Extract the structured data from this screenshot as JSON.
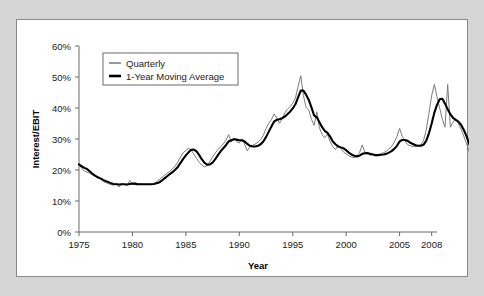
{
  "figure": {
    "background_color": "#d5d5d5",
    "panel_color": "#ffffff",
    "border_color": "#8a8a8a"
  },
  "chart_data": {
    "type": "line",
    "title": "",
    "xlabel": "Year",
    "ylabel": "Interest/EBIT",
    "xlim": [
      1975,
      2008.5
    ],
    "ylim": [
      0,
      60
    ],
    "grid": false,
    "legend_position": "top-left",
    "x_tick_labels": [
      "1975",
      "1980",
      "1985",
      "1990",
      "1995",
      "2000",
      "2005",
      "2008"
    ],
    "x_ticks": [
      1975,
      1980,
      1985,
      1990,
      1995,
      2000,
      2005,
      2008
    ],
    "y_tick_labels": [
      "0%",
      "10%",
      "20%",
      "30%",
      "40%",
      "50%",
      "60%"
    ],
    "y_ticks": [
      0,
      10,
      20,
      30,
      40,
      50,
      60
    ],
    "series": [
      {
        "name": "Quarterly",
        "color": "#6e6e6e",
        "width": 0.9,
        "x_start": 1975.0,
        "x_step": 0.25,
        "values": [
          21.8,
          20.6,
          19.6,
          19.3,
          19.0,
          18.4,
          18.0,
          17.3,
          17.4,
          16.3,
          16.0,
          15.6,
          15.3,
          15.1,
          15.8,
          14.5,
          15.6,
          15.3,
          15.1,
          16.6,
          15.4,
          15.3,
          15.2,
          15.6,
          15.4,
          15.4,
          15.4,
          15.4,
          15.6,
          16.2,
          16.9,
          17.6,
          18.3,
          19.0,
          19.6,
          20.4,
          21.2,
          22.6,
          24.2,
          25.6,
          26.3,
          27.0,
          26.4,
          25.1,
          23.7,
          22.5,
          21.5,
          21.0,
          21.4,
          22.8,
          24.2,
          25.5,
          26.6,
          27.5,
          28.4,
          29.6,
          31.4,
          29.0,
          30.3,
          29.2,
          28.7,
          30.0,
          28.3,
          26.2,
          27.6,
          28.0,
          28.4,
          29.0,
          29.8,
          31.2,
          33.4,
          35.0,
          36.2,
          38.1,
          36.8,
          35.1,
          36.4,
          38.4,
          39.6,
          40.4,
          41.6,
          43.2,
          46.9,
          50.4,
          44.0,
          40.2,
          39.4,
          36.4,
          34.4,
          38.8,
          33.6,
          31.4,
          30.4,
          31.6,
          29.2,
          27.5,
          26.6,
          28.1,
          26.8,
          25.8,
          25.2,
          24.6,
          24.2,
          24.0,
          24.4,
          25.6,
          28.1,
          25.8,
          25.2,
          24.8,
          25.0,
          24.6,
          24.8,
          25.2,
          25.6,
          26.0,
          26.8,
          27.6,
          29.0,
          30.8,
          33.4,
          30.8,
          29.4,
          28.2,
          27.8,
          27.6,
          27.6,
          27.8,
          28.2,
          29.6,
          33.0,
          38.4,
          44.0,
          47.6,
          43.6,
          40.0,
          36.4,
          33.8,
          47.6,
          33.8,
          35.4,
          36.6,
          35.0,
          33.2,
          31.0,
          28.6,
          26.0,
          23.8,
          22.0,
          20.6,
          22.8,
          23.6,
          24.2,
          25.8,
          24.6,
          25.4,
          26.2,
          27.0,
          27.6,
          28.2,
          28.6,
          29.2,
          30.0,
          31.4,
          52.4,
          34.6,
          36.8,
          38.8,
          34.2,
          49.8,
          59.6
        ]
      },
      {
        "name": "1-Year Moving Average",
        "color": "#000000",
        "width": 2.1,
        "x_start": 1975.0,
        "x_step": 0.25,
        "values": [
          21.8,
          21.2,
          20.7,
          20.3,
          19.6,
          18.8,
          18.2,
          17.7,
          17.3,
          16.8,
          16.4,
          16.1,
          15.7,
          15.5,
          15.4,
          15.3,
          15.4,
          15.4,
          15.3,
          15.5,
          15.6,
          15.6,
          15.4,
          15.4,
          15.4,
          15.4,
          15.4,
          15.4,
          15.5,
          15.7,
          16.0,
          16.6,
          17.3,
          18.0,
          18.7,
          19.3,
          20.1,
          21.0,
          22.3,
          23.6,
          24.7,
          25.7,
          26.5,
          26.6,
          26.0,
          24.8,
          23.4,
          22.3,
          21.7,
          21.8,
          22.4,
          23.5,
          24.8,
          26.0,
          27.0,
          28.0,
          29.2,
          29.6,
          29.9,
          29.8,
          29.6,
          29.6,
          29.2,
          28.4,
          27.8,
          27.6,
          27.6,
          27.8,
          28.3,
          29.2,
          30.6,
          32.3,
          34.0,
          35.6,
          36.2,
          36.4,
          36.7,
          37.2,
          38.0,
          38.8,
          39.9,
          41.2,
          43.4,
          45.6,
          45.6,
          44.3,
          42.6,
          40.2,
          37.6,
          37.0,
          35.4,
          33.8,
          32.6,
          32.0,
          30.8,
          29.2,
          28.3,
          27.6,
          27.3,
          27.0,
          26.4,
          25.6,
          25.0,
          24.6,
          24.4,
          24.6,
          25.2,
          25.4,
          25.5,
          25.2,
          25.0,
          24.8,
          24.8,
          24.9,
          25.0,
          25.2,
          25.6,
          26.1,
          26.8,
          27.8,
          29.2,
          29.7,
          29.7,
          29.4,
          28.8,
          28.4,
          28.0,
          27.8,
          27.8,
          28.2,
          29.5,
          31.9,
          35.0,
          38.5,
          41.0,
          42.8,
          43.0,
          41.4,
          39.6,
          38.0,
          36.8,
          36.2,
          35.6,
          34.6,
          33.0,
          31.0,
          28.6,
          26.2,
          24.2,
          23.0,
          22.6,
          22.6,
          23.2,
          24.4,
          24.6,
          25.0,
          25.4,
          26.0,
          26.6,
          27.2,
          27.6,
          28.2,
          28.8,
          29.7,
          31.6,
          33.8,
          35.0,
          36.4,
          37.2,
          39.8,
          43.0
        ]
      }
    ]
  }
}
